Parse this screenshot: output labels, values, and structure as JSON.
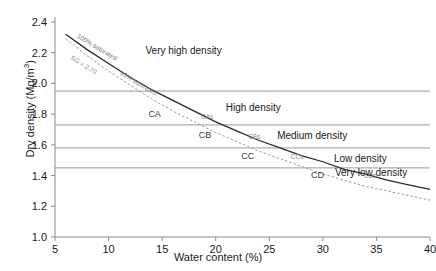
{
  "chart_data": {
    "type": "line",
    "title": "",
    "xlabel": "Water content (%)",
    "ylabel": "Dry density (Mg/m3)",
    "ylabel_display": "Dry density (Mg/m",
    "ylabel_sup": "3",
    "ylabel_tail": ")",
    "xlim": [
      5,
      40
    ],
    "ylim": [
      1.0,
      2.4
    ],
    "xticks": [
      "5",
      "10",
      "15",
      "20",
      "25",
      "30",
      "35",
      "40"
    ],
    "xtick_values": [
      5,
      10,
      15,
      20,
      25,
      30,
      35,
      40
    ],
    "yticks": [
      "1.0",
      "1.2",
      "1.4",
      "1.6",
      "1.8",
      "2.0",
      "2.2",
      "2.4"
    ],
    "ytick_values": [
      1.0,
      1.2,
      1.4,
      1.6,
      1.8,
      2.0,
      2.2,
      2.4
    ],
    "grid": false,
    "legend": "none",
    "series": [
      {
        "name": "100% saturated",
        "style": "solid",
        "color": "#2a2a2a",
        "x": [
          6.0,
          8.0,
          10.0,
          12.0,
          14.0,
          16.0,
          18.0,
          20.0,
          22.0,
          24.0,
          26.0,
          28.0,
          30.0,
          32.0,
          34.0,
          36.0,
          38.0,
          40.0
        ],
        "y": [
          2.32,
          2.22,
          2.13,
          2.04,
          1.96,
          1.89,
          1.82,
          1.75,
          1.69,
          1.63,
          1.58,
          1.53,
          1.49,
          1.44,
          1.41,
          1.37,
          1.34,
          1.31
        ]
      },
      {
        "name": "95% saturated",
        "style": "dashed",
        "color": "#9a9a9a",
        "x": [
          6.0,
          8.0,
          10.0,
          12.0,
          14.0,
          16.0,
          18.0,
          20.0,
          22.0,
          24.0,
          26.0,
          28.0,
          30.0,
          32.0,
          34.0,
          36.0,
          38.0,
          40.0
        ],
        "y": [
          2.29,
          2.18,
          2.08,
          1.99,
          1.9,
          1.82,
          1.75,
          1.68,
          1.62,
          1.56,
          1.51,
          1.46,
          1.41,
          1.37,
          1.33,
          1.3,
          1.27,
          1.24
        ]
      }
    ],
    "curve_labels": [
      {
        "text": "100% saturated",
        "x": 7.0,
        "y": 2.3
      },
      {
        "text": "SG = 2.70",
        "x": 6.4,
        "y": 2.16
      },
      {
        "text": "95% saturated",
        "x": 11.0,
        "y": 2.06
      }
    ],
    "band_lines": [
      {
        "value": 1.95,
        "from": 5,
        "to": 40
      },
      {
        "value": 1.73,
        "from": 5,
        "to": 40
      },
      {
        "value": 1.58,
        "from": 5,
        "to": 40
      },
      {
        "value": 1.45,
        "from": 5,
        "to": 40
      }
    ],
    "region_labels": [
      {
        "text": "Very high density",
        "x": 17.0,
        "y": 2.21
      },
      {
        "text": "High density",
        "x": 23.5,
        "y": 1.84
      },
      {
        "text": "Medium density",
        "x": 29.0,
        "y": 1.66
      },
      {
        "text": "Low density",
        "x": 33.5,
        "y": 1.51
      },
      {
        "text": "Very low density",
        "x": 34.5,
        "y": 1.42
      }
    ],
    "point_labels": [
      {
        "text": "CA",
        "x": 14.3,
        "y": 1.8
      },
      {
        "text": "CAs",
        "x": 19.2,
        "y": 1.785
      },
      {
        "text": "CB",
        "x": 19.0,
        "y": 1.665
      },
      {
        "text": "CBs",
        "x": 23.6,
        "y": 1.655
      },
      {
        "text": "CC",
        "x": 23.0,
        "y": 1.525
      },
      {
        "text": "CCs",
        "x": 27.6,
        "y": 1.525
      },
      {
        "text": "CD",
        "x": 29.5,
        "y": 1.405
      },
      {
        "text": "CDs",
        "x": 34.4,
        "y": 1.405
      }
    ]
  },
  "axis": {
    "x_title": "Water content (%)",
    "y_title_main": "Dry density (Mg/m",
    "y_title_sup": "3",
    "y_title_end": ")"
  }
}
